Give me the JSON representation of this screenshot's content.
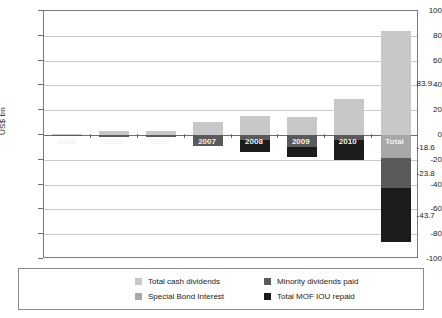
{
  "chart_data": {
    "type": "bar",
    "title": "",
    "subtitle": "",
    "xlabel": "",
    "ylabel": "US$ bn",
    "ylim": [
      -100,
      100
    ],
    "yticks": [
      100,
      80,
      60,
      40,
      20,
      0,
      -20,
      -40,
      -60,
      -80,
      -100
    ],
    "ytick_labels": [
      "100",
      "80",
      "60",
      "40",
      "20",
      "0",
      "-20",
      "-40",
      "-60",
      "-80",
      "-100"
    ],
    "grid": true,
    "stacked": true,
    "legend_position": "bottom",
    "categories": [
      "2004",
      "2005",
      "2006",
      "2007",
      "2008",
      "2009",
      "2010",
      "Total"
    ],
    "series": [
      {
        "name": "Total cash dividends",
        "color": "#c8c8c8",
        "values": [
          0.8,
          3.4,
          3.6,
          10.6,
          15.3,
          14.6,
          28.7,
          83.9
        ]
      },
      {
        "name": "Special Bond Interest",
        "color": "#a8a8a8",
        "values": [
          0,
          0,
          0,
          0,
          0,
          0,
          0,
          -18.6
        ]
      },
      {
        "name": "Minority dividends paid",
        "color": "#5a5a5a",
        "values": [
          -0.4,
          -1.5,
          -1.7,
          -9.2,
          -4.4,
          -9.5,
          -4.0,
          -23.8
        ]
      },
      {
        "name": "Total MOF IOU repaid",
        "color": "#1c1c1c",
        "values": [
          0,
          0,
          0,
          0,
          -9.0,
          -8.6,
          -16.0,
          -43.7
        ]
      }
    ],
    "value_labels": [
      {
        "category": "Total",
        "series": "Total cash dividends",
        "text": "83.9",
        "value": 83.9
      },
      {
        "category": "Total",
        "series": "Minority dividends paid",
        "text": "-23.8",
        "value": -23.8
      },
      {
        "category": "Total",
        "series": "Special Bond Interest",
        "text": "-18.6",
        "value": -18.6
      },
      {
        "category": "Total",
        "series": "Total MOF IOU repaid",
        "text": "-43.7",
        "value": -43.7
      }
    ],
    "legend": [
      {
        "label": "Total cash dividends",
        "color": "#c8c8c8"
      },
      {
        "label": "Minority dividends paid",
        "color": "#5a5a5a"
      },
      {
        "label": "Special Bond Interest",
        "color": "#a8a8a8"
      },
      {
        "label": "Total MOF IOU repaid",
        "color": "#1c1c1c"
      }
    ]
  }
}
